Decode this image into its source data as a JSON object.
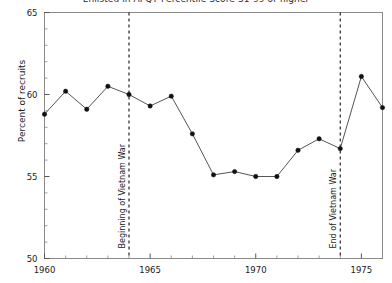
{
  "chart_data": {
    "type": "line",
    "title": "Enlisted in AFQT Percentile Score 31-99 or higher",
    "title_clipped": true,
    "xlabel": "",
    "ylabel": "Percent of recruits",
    "xlim": [
      1960,
      1976
    ],
    "ylim": [
      50,
      65
    ],
    "xticks": [
      1960,
      1965,
      1970,
      1975
    ],
    "xticklabels": [
      "1960",
      "1965",
      "1970",
      "1975"
    ],
    "yticks": [
      50,
      55,
      60,
      65
    ],
    "yticklabels": [
      "50",
      "55",
      "60",
      "65"
    ],
    "x_minor_tick_step": 1,
    "y_minor_tick_step": 1,
    "grid": false,
    "legend": null,
    "marker": "filled-circle",
    "line_color": "#555555",
    "marker_color": "#111111",
    "x": [
      1960,
      1961,
      1962,
      1963,
      1964,
      1965,
      1966,
      1967,
      1968,
      1969,
      1970,
      1971,
      1972,
      1973,
      1974,
      1975,
      1976
    ],
    "values": [
      58.8,
      60.2,
      59.1,
      60.5,
      60.0,
      59.3,
      59.9,
      57.6,
      55.1,
      55.3,
      55.0,
      55.0,
      56.6,
      57.3,
      56.7,
      61.1,
      59.2
    ],
    "series": [
      {
        "name": "Percent of recruits",
        "values": [
          58.8,
          60.2,
          59.1,
          60.5,
          60.0,
          59.3,
          59.9,
          57.6,
          55.1,
          55.3,
          55.0,
          55.0,
          56.6,
          57.3,
          56.7,
          61.1,
          59.2
        ]
      }
    ],
    "annotations": [
      {
        "label": "Beginning of Vietnam War",
        "x": 1964,
        "style": "vertical-dashed-line",
        "orientation": "vertical-text"
      },
      {
        "label": "End of Vietnam War",
        "x": 1974,
        "style": "vertical-dashed-line",
        "orientation": "vertical-text"
      }
    ]
  }
}
